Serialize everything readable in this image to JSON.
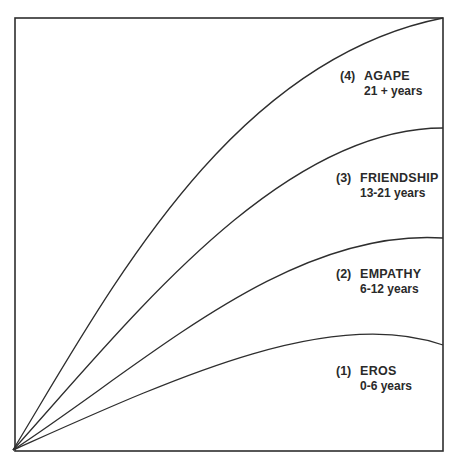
{
  "diagram": {
    "type": "stages-of-love",
    "colors": {
      "line": "#2e2e2e",
      "text": "#2a2a2a",
      "background": "#ffffff"
    },
    "stages": [
      {
        "number": "(4)",
        "name": "AGAPE",
        "age": "21 + years"
      },
      {
        "number": "(3)",
        "name": "FRIENDSHIP",
        "age": "13-21 years"
      },
      {
        "number": "(2)",
        "name": "EMPATHY",
        "age": "6-12 years"
      },
      {
        "number": "(1)",
        "name": "EROS",
        "age": "0-6 years"
      }
    ]
  }
}
